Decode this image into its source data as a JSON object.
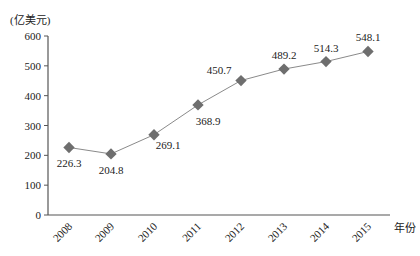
{
  "chart_data": {
    "type": "line",
    "title": "",
    "ylabel": "(亿美元)",
    "xlabel": "年份",
    "categories": [
      "2008",
      "2009",
      "2010",
      "2011",
      "2012",
      "2013",
      "2014",
      "2015"
    ],
    "values": [
      226.3,
      204.8,
      269.1,
      368.9,
      450.7,
      489.2,
      514.3,
      548.1
    ],
    "data_labels": [
      "226.3",
      "204.8",
      "269.1",
      "368.9",
      "450.7",
      "489.2",
      "514.3",
      "548.1"
    ],
    "ylim": [
      0,
      600
    ],
    "yticks": [
      0,
      100,
      200,
      300,
      400,
      500,
      600
    ],
    "grid": false,
    "legend": null,
    "colors": {
      "line": "#8a8a8a",
      "marker": "#6e6e6e",
      "axis": "#555555"
    }
  }
}
